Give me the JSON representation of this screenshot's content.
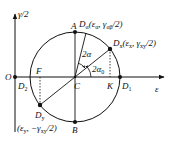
{
  "diagram": {
    "type": "mohr-strain-circle",
    "axes": {
      "x_label": "ε",
      "y_label": "γ/2",
      "origin_label": "O"
    },
    "center": {
      "label": "C"
    },
    "points": {
      "A": {
        "label": "A"
      },
      "B": {
        "label": "B"
      },
      "D1": {
        "label": "D",
        "sub": "1"
      },
      "D2": {
        "label": "D",
        "sub": "2"
      },
      "F": {
        "label": "F"
      },
      "K": {
        "label": "K"
      },
      "Da": {
        "label": "D",
        "sub": "α",
        "coords": "(ε",
        "coords_sub": "α",
        "coords_rest": ", γ",
        "coords_sub2": "αβ",
        "coords_end": "/2)"
      },
      "Dx": {
        "label": "D",
        "sub": "x",
        "coords": "(ε",
        "coords_sub": "x",
        "coords_rest": ", γ",
        "coords_sub2": "xy",
        "coords_end": "/2)"
      },
      "Dy": {
        "label": "D",
        "sub": "y",
        "coords": "(ε",
        "coords_sub": "y",
        "coords_rest": ", −γ",
        "coords_sub2": "xy",
        "coords_end": "/2)"
      }
    },
    "angles": {
      "two_alpha": {
        "label": "2α"
      },
      "two_alpha0": {
        "label": "2α",
        "sub": "0"
      }
    },
    "colors": {
      "stroke": "#111111",
      "background": "#ffffff"
    }
  }
}
